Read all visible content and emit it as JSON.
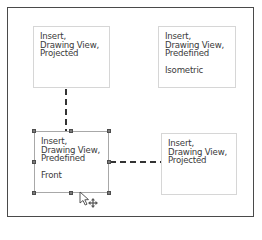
{
  "diagram": {
    "nodes": [
      {
        "id": "top-left",
        "lines": [
          "Insert,",
          "Drawing View,",
          "Projected"
        ],
        "sublabel": ""
      },
      {
        "id": "top-right",
        "lines": [
          "Insert,",
          "Drawing View,",
          "Predefined"
        ],
        "sublabel": "Isometric"
      },
      {
        "id": "bottom-left",
        "lines": [
          "Insert,",
          "Drawing View,",
          "Predefined"
        ],
        "sublabel": "Front",
        "selected": true
      },
      {
        "id": "bottom-right",
        "lines": [
          "Insert,",
          "Drawing View,",
          "Projected"
        ],
        "sublabel": ""
      }
    ],
    "edges": [
      {
        "from": "bottom-left",
        "to": "top-left",
        "style": "dashed",
        "orientation": "vertical"
      },
      {
        "from": "bottom-left",
        "to": "bottom-right",
        "style": "dashed",
        "orientation": "horizontal"
      }
    ],
    "cursor": "move-cursor-icon"
  }
}
